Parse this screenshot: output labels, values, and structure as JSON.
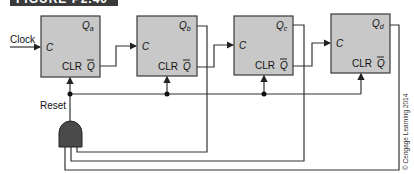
{
  "figure": {
    "title": "FIGURE P2.40",
    "credit": "© Cengage Learning 2014"
  },
  "labels": {
    "clock": "Clock",
    "reset": "Reset"
  },
  "flipflops": [
    {
      "id": "a",
      "clock_label": "C",
      "q_label": "Q",
      "q_sub": "a",
      "clr_label": "CLR",
      "qbar_label": "Q"
    },
    {
      "id": "b",
      "clock_label": "C",
      "q_label": "Q",
      "q_sub": "b",
      "clr_label": "CLR",
      "qbar_label": "Q"
    },
    {
      "id": "c",
      "clock_label": "C",
      "q_label": "Q",
      "q_sub": "c",
      "clr_label": "CLR",
      "qbar_label": "Q"
    },
    {
      "id": "d",
      "clock_label": "C",
      "q_label": "Q",
      "q_sub": "d",
      "clr_label": "CLR",
      "qbar_label": "Q"
    }
  ],
  "colors": {
    "box_fill": "#c8c8c8",
    "box_stroke": "#3a3a3a",
    "wire": "#333333",
    "gate_fill": "#4a4a4a"
  }
}
